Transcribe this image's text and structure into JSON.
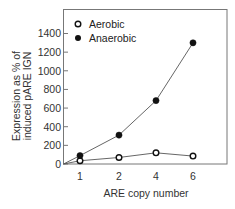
{
  "chart_data": {
    "type": "line",
    "title": "",
    "xlabel": "ARE copy number",
    "ylabel_lines": [
      "Expression as % of",
      "induced pARE IGN"
    ],
    "ylabel": "Expression as % of induced pARE IGN",
    "x": [
      1,
      2,
      4,
      6
    ],
    "categories": [
      "1",
      "2",
      "4",
      "6"
    ],
    "ylim": [
      0,
      1400
    ],
    "yticks": [
      0,
      200,
      400,
      600,
      800,
      1000,
      1200,
      1400
    ],
    "grid": false,
    "legend_position": "upper left",
    "series": [
      {
        "name": "Aerobic",
        "marker": "open-circle",
        "values": [
          35,
          70,
          120,
          85
        ]
      },
      {
        "name": "Anaerobic",
        "marker": "filled-circle",
        "values": [
          90,
          310,
          680,
          1300
        ]
      }
    ]
  },
  "legend": {
    "items": [
      {
        "label": "Aerobic",
        "marker": "open-circle"
      },
      {
        "label": "Anaerobic",
        "marker": "filled-circle"
      }
    ]
  },
  "colors": {
    "line": "#555555",
    "marker": "#111111",
    "frame": "#777777"
  }
}
